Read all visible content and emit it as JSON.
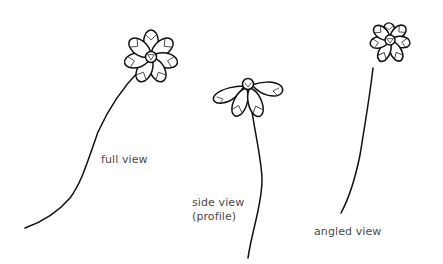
{
  "diagram": {
    "background": "#ffffff",
    "ink_color": "#111111",
    "label_color": "#4a4a4a",
    "flowers": [
      {
        "id": "full-view",
        "label_lines": [
          "full view"
        ],
        "center": [
          151,
          57
        ],
        "petal_count": 7
      },
      {
        "id": "side-view",
        "label_lines": [
          "side view",
          "(profile)"
        ],
        "center": [
          248,
          84
        ],
        "petal_count": 4
      },
      {
        "id": "angled-view",
        "label_lines": [
          "angled view"
        ],
        "center": [
          390,
          38
        ],
        "petal_count": 7
      }
    ]
  }
}
